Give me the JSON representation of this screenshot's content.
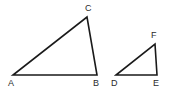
{
  "figure": {
    "background_color": "#ffffff",
    "stroke_color": "#1a1a1a",
    "label_color": "#2b2b2b",
    "width": 175,
    "height": 91,
    "shapes": [
      {
        "name": "triangle-abc",
        "vertices": [
          {
            "label": "A",
            "x": 13,
            "y": 75,
            "label_x": 8,
            "label_y": 86
          },
          {
            "label": "B",
            "x": 97,
            "y": 75,
            "label_x": 93,
            "label_y": 86
          },
          {
            "label": "C",
            "x": 87,
            "y": 17,
            "label_x": 85,
            "label_y": 11
          }
        ],
        "path": "M 13 75 L 97 75 L 87 17 Z"
      },
      {
        "name": "triangle-def",
        "vertices": [
          {
            "label": "D",
            "x": 116,
            "y": 75,
            "label_x": 111,
            "label_y": 86
          },
          {
            "label": "E",
            "x": 157,
            "y": 75,
            "label_x": 153,
            "label_y": 86
          },
          {
            "label": "F",
            "x": 155,
            "y": 44,
            "label_x": 151,
            "label_y": 38
          }
        ],
        "path": "M 116 75 L 157 75 L 155 44 Z"
      }
    ]
  }
}
